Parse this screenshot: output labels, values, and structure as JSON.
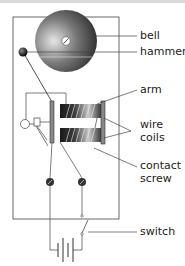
{
  "labels": {
    "bell": "bell",
    "hammer": "hammer",
    "arm": "arm",
    "wire_coils_1": "wire",
    "wire_coils_2": "coils",
    "contact_screw_1": "contact",
    "contact_screw_2": "screw",
    "switch": "switch"
  },
  "colors": {
    "line": "#333333",
    "bell_dark": "#2a2a2a",
    "bell_light": "#d8d8d8",
    "coil_dark": "#1e1e1e",
    "coil_light": "#bdbdbd",
    "board": "#ffffff"
  }
}
